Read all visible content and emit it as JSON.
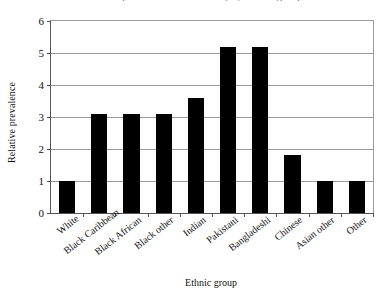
{
  "chart_data": {
    "type": "bar",
    "title": "Relative prevalence of diabetes, by ethnic group",
    "xlabel": "Ethnic group",
    "ylabel": "Relative prevalence",
    "categories": [
      "White",
      "Black Caribbean",
      "Black African",
      "Black other",
      "Indian",
      "Pakistani",
      "Bangladeshi",
      "Chinese",
      "Asian other",
      "Other"
    ],
    "values": [
      1.0,
      3.1,
      3.1,
      3.1,
      3.6,
      5.2,
      5.2,
      1.8,
      1.0,
      1.0
    ],
    "ylim": [
      0,
      6
    ],
    "yticks": [
      0,
      1,
      2,
      3,
      4,
      5,
      6
    ],
    "ytick_labels": [
      "0",
      "1",
      "2",
      "3",
      "4",
      "5",
      "6"
    ],
    "grid": true,
    "legend": false,
    "bar_color": "#000000",
    "grid_color": "#9a9a9a",
    "axis_color": "#555555"
  }
}
